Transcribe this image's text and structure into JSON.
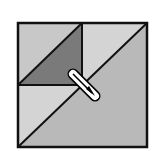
{
  "diagram": {
    "colors": {
      "background": "#ffffff",
      "outline": "#111111",
      "light_gray": "#d2d2d2",
      "medium_gray": "#b9b9b9",
      "dark_gray": "#7a7a7a",
      "needle_fill": "#ffffff",
      "needle_line": "#000000"
    },
    "block": {
      "x": 18,
      "y": 23,
      "size": 129
    },
    "regions": [
      {
        "name": "top-left-upper-triangle",
        "shade": "light_gray"
      },
      {
        "name": "top-left-lower-triangle",
        "shade": "dark_gray"
      },
      {
        "name": "top-right-upper-triangle",
        "shade": "light_gray"
      },
      {
        "name": "bottom-left-upper-triangle",
        "shade": "light_gray"
      },
      {
        "name": "large-lower-right-triangle",
        "shade": "medium_gray"
      }
    ],
    "needle": {
      "x1": 73,
      "y1": 74,
      "x2": 95,
      "y2": 96
    }
  }
}
